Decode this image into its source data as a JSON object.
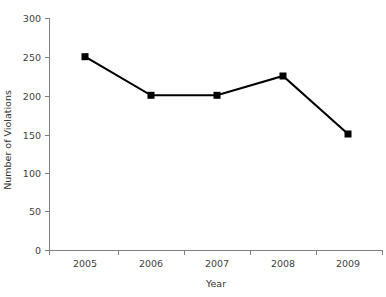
{
  "chart_data": {
    "type": "line",
    "title": "",
    "subtitle": "",
    "xlabel": "Year",
    "ylabel": "Number of Violations",
    "categories": [
      "2005",
      "2006",
      "2007",
      "2008",
      "2009"
    ],
    "values": [
      250,
      200,
      200,
      225,
      150
    ],
    "series": [
      {
        "name": "Number of Violations",
        "values": [
          250,
          200,
          200,
          225,
          150
        ]
      }
    ],
    "ylim": [
      0,
      300
    ],
    "yticks": [
      0,
      50,
      100,
      150,
      200,
      250,
      300
    ],
    "ytick_labels": [
      "0",
      "50",
      "100",
      "150",
      "200",
      "250",
      "300"
    ],
    "xtick_labels": [
      "2005",
      "2006",
      "2007",
      "2008",
      "2009"
    ],
    "grid": false,
    "legend": false,
    "legend_position": "none",
    "marker": "square",
    "marker_color": "#000000",
    "line_color": "#000000",
    "axis_color": "#808080",
    "text_color": "#3f3f3f",
    "background_color": "#ffffff",
    "annotations": [],
    "data_labels": []
  },
  "geometry": {
    "plot_left": 49,
    "plot_right": 383,
    "plot_top": 18,
    "plot_bottom": 250,
    "point_x": [
      85,
      151,
      217,
      283,
      348
    ],
    "point_y": [
      54,
      95,
      95,
      76,
      135
    ],
    "tick_y": [
      250,
      211,
      173,
      135,
      96,
      57,
      18
    ],
    "boundary_x": [
      49,
      118,
      184,
      250,
      316,
      383
    ],
    "xlabel_y": 283,
    "ylabel_cx": 11,
    "ylabel_cy": 140
  }
}
